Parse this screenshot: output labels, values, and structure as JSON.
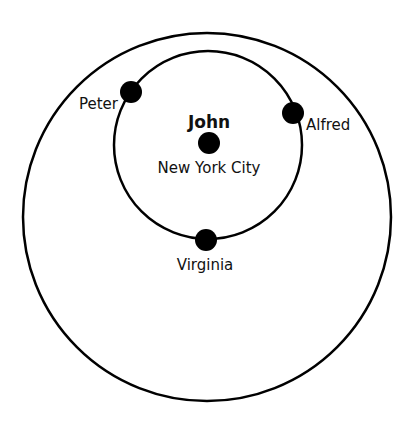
{
  "diagram": {
    "type": "concentric-circles",
    "colors": {
      "background": "#ffffff",
      "stroke": "#000000",
      "text": "#111111"
    },
    "circles": {
      "outer": {
        "cx": 207,
        "cy": 217,
        "r": 184
      },
      "inner": {
        "cx": 208,
        "cy": 145,
        "r": 94
      }
    },
    "center": {
      "name": "John",
      "location": "New York City",
      "dot": {
        "cx": 209,
        "cy": 143,
        "r": 11
      }
    },
    "nodes": [
      {
        "name": "Peter",
        "dot": {
          "cx": 131,
          "cy": 92,
          "r": 11
        }
      },
      {
        "name": "Alfred",
        "dot": {
          "cx": 293,
          "cy": 113,
          "r": 11
        }
      },
      {
        "name": "Virginia",
        "dot": {
          "cx": 206,
          "cy": 240,
          "r": 11
        }
      }
    ]
  }
}
